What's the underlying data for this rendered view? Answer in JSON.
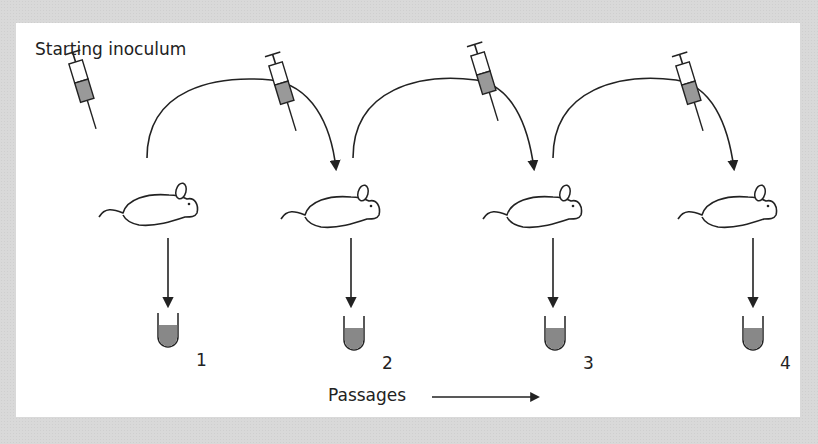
{
  "diagram": {
    "title": "Starting inoculum",
    "passages_label": "Passages",
    "tube_labels": [
      "1",
      "2",
      "3",
      "4"
    ],
    "colors": {
      "background": "#d9d9d9",
      "panel": "#ffffff",
      "stroke": "#222222",
      "fill": "#888888"
    },
    "icons": [
      "syringe-icon",
      "mouse-icon",
      "test-tube-icon",
      "arrow-icon"
    ]
  }
}
